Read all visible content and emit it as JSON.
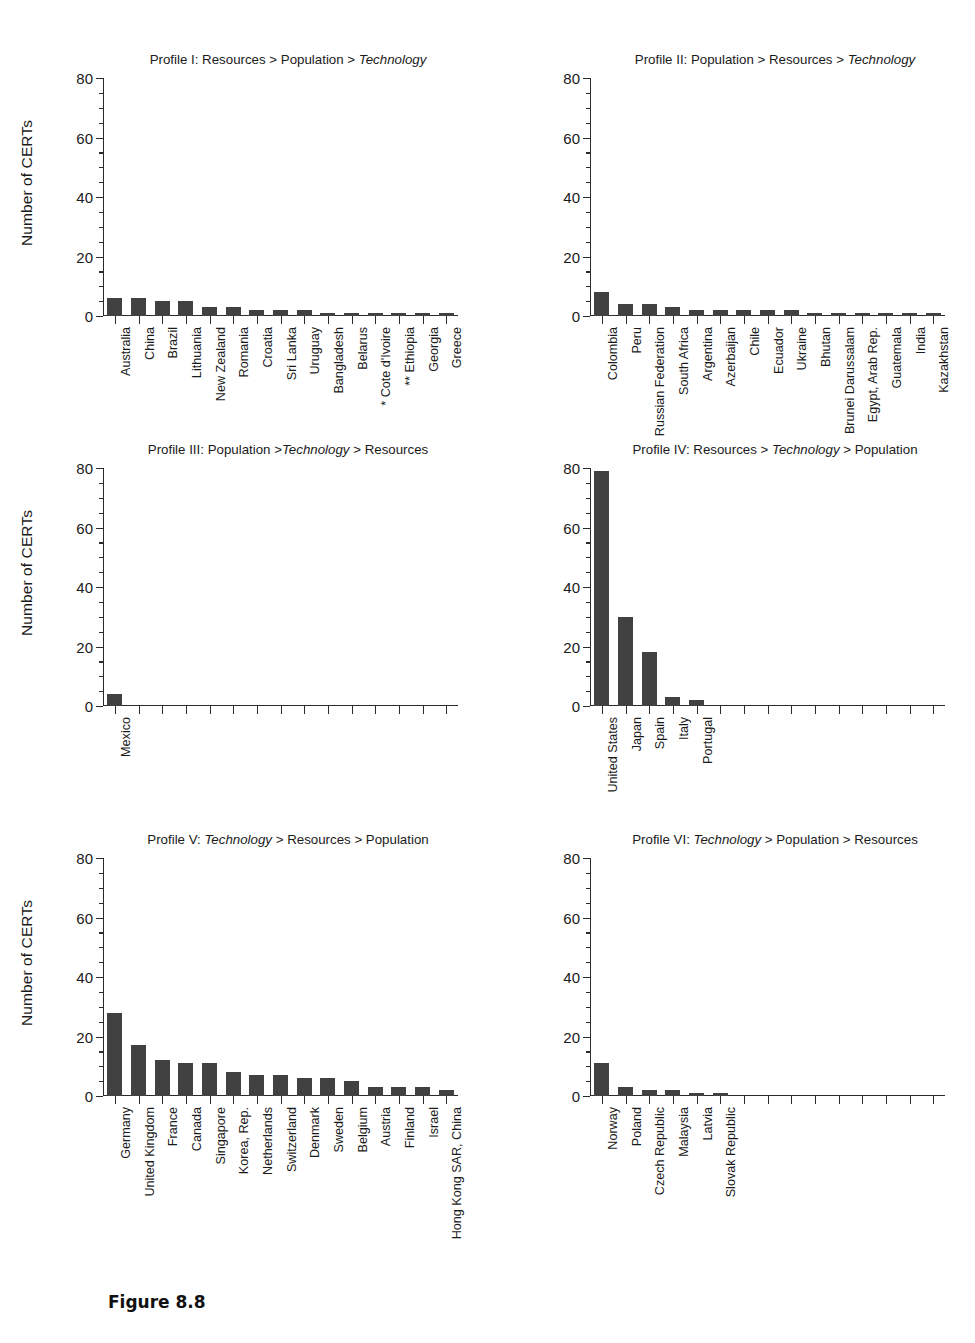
{
  "figure": {
    "caption": "Figure 8.8",
    "ylabel": "Number of CERTs",
    "yticks": [
      "0",
      "20",
      "40",
      "60",
      "80"
    ]
  },
  "chart_data": [
    {
      "type": "bar",
      "id": "profile-1",
      "title_plain": "Profile I: Resources > Population > Technology",
      "title_parts": [
        {
          "text": "Profile I: Resources > Population > ",
          "italic": false
        },
        {
          "text": "Technology",
          "italic": true
        }
      ],
      "xlabel": "",
      "ylabel": "Number of CERTs",
      "ylim": [
        0,
        80
      ],
      "ytick_values": [
        0,
        20,
        40,
        60,
        80
      ],
      "grid": false,
      "n_slots": 15,
      "categories": [
        "Australia",
        "China",
        "Brazil",
        "Lithuania",
        "New Zealand",
        "Romania",
        "Croatia",
        "Sri Lanka",
        "Uruguay",
        "Bangladesh",
        "Belarus",
        "* Cote d'Ivoire",
        "** Ethiopia",
        "Georgia",
        "Greece"
      ],
      "values": [
        6,
        6,
        5,
        5,
        3,
        3,
        2,
        2,
        2,
        1,
        1,
        1,
        1,
        1,
        1
      ]
    },
    {
      "type": "bar",
      "id": "profile-2",
      "title_plain": "Profile II: Population > Resources > Technology",
      "title_parts": [
        {
          "text": "Profile II: Population > Resources > ",
          "italic": false
        },
        {
          "text": "Technology",
          "italic": true
        }
      ],
      "xlabel": "",
      "ylabel": "Number of CERTs",
      "ylim": [
        0,
        80
      ],
      "ytick_values": [
        0,
        20,
        40,
        60,
        80
      ],
      "grid": false,
      "n_slots": 15,
      "categories": [
        "Colombia",
        "Peru",
        "Russian Federation",
        "South Africa",
        "Argentina",
        "Azerbaijan",
        "Chile",
        "Ecuador",
        "Ukraine",
        "Bhutan",
        "Brunei Darussalam",
        "Egypt, Arab Rep.",
        "Guatemala",
        "India",
        "Kazakhstan"
      ],
      "values": [
        8,
        4,
        4,
        3,
        2,
        2,
        2,
        2,
        2,
        1,
        1,
        1,
        1,
        1,
        1
      ]
    },
    {
      "type": "bar",
      "id": "profile-3",
      "title_plain": "Profile III: Population >Technology > Resources",
      "title_parts": [
        {
          "text": "Profile III: Population >",
          "italic": false
        },
        {
          "text": "Technology",
          "italic": true
        },
        {
          "text": " > Resources",
          "italic": false
        }
      ],
      "xlabel": "",
      "ylabel": "Number of CERTs",
      "ylim": [
        0,
        80
      ],
      "ytick_values": [
        0,
        20,
        40,
        60,
        80
      ],
      "grid": false,
      "n_slots": 15,
      "categories": [
        "Mexico"
      ],
      "values": [
        4
      ]
    },
    {
      "type": "bar",
      "id": "profile-4",
      "title_plain": "Profile IV: Resources > Technology > Population",
      "title_parts": [
        {
          "text": "Profile IV: Resources > ",
          "italic": false
        },
        {
          "text": "Technology",
          "italic": true
        },
        {
          "text": " > Population",
          "italic": false
        }
      ],
      "xlabel": "",
      "ylabel": "Number of CERTs",
      "ylim": [
        0,
        80
      ],
      "ytick_values": [
        0,
        20,
        40,
        60,
        80
      ],
      "grid": false,
      "n_slots": 15,
      "categories": [
        "United States",
        "Japan",
        "Spain",
        "Italy",
        "Portugal"
      ],
      "values": [
        79,
        30,
        18,
        3,
        2
      ]
    },
    {
      "type": "bar",
      "id": "profile-5",
      "title_plain": "Profile V: Technology > Resources > Population",
      "title_parts": [
        {
          "text": "Profile V: ",
          "italic": false
        },
        {
          "text": "Technology",
          "italic": true
        },
        {
          "text": " > Resources > Population",
          "italic": false
        }
      ],
      "xlabel": "",
      "ylabel": "Number of CERTs",
      "ylim": [
        0,
        80
      ],
      "ytick_values": [
        0,
        20,
        40,
        60,
        80
      ],
      "grid": false,
      "n_slots": 15,
      "categories": [
        "Germany",
        "United Kingdom",
        "France",
        "Canada",
        "Singapore",
        "Korea, Rep.",
        "Netherlands",
        "Switzerland",
        "Denmark",
        "Sweden",
        "Belgium",
        "Austria",
        "Finland",
        "Israel",
        "Hong Kong SAR, China"
      ],
      "values": [
        28,
        17,
        12,
        11,
        11,
        8,
        7,
        7,
        6,
        6,
        5,
        3,
        3,
        3,
        2
      ]
    },
    {
      "type": "bar",
      "id": "profile-6",
      "title_plain": "Profile VI: Technology > Population > Resources",
      "title_parts": [
        {
          "text": "Profile VI: ",
          "italic": false
        },
        {
          "text": "Technology",
          "italic": true
        },
        {
          "text": " > Population > Resources",
          "italic": false
        }
      ],
      "xlabel": "",
      "ylabel": "Number of CERTs",
      "ylim": [
        0,
        80
      ],
      "ytick_values": [
        0,
        20,
        40,
        60,
        80
      ],
      "grid": false,
      "n_slots": 15,
      "categories": [
        "Norway",
        "Poland",
        "Czech Republic",
        "Malaysia",
        "Latvia",
        "Slovak Republic"
      ],
      "values": [
        11,
        3,
        2,
        2,
        1,
        1
      ]
    }
  ],
  "colors": {
    "bar": "#414141",
    "axis": "#2b2b2b",
    "text": "#1a1a1a",
    "background": "#ffffff"
  }
}
